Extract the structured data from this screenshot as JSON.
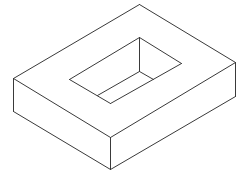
{
  "diagram": {
    "type": "isometric-line-drawing",
    "background": "#ffffff",
    "stroke_color": "#3a3a3a",
    "outer_block": {
      "top_face": [
        {
          "name": "block-top-left-edge",
          "x1": 13,
          "y1": 78,
          "x2": 139,
          "y2": 4
        },
        {
          "name": "block-top-back-edge",
          "x1": 139,
          "y1": 4,
          "x2": 235,
          "y2": 62
        },
        {
          "name": "block-top-right-edge",
          "x1": 235,
          "y1": 62,
          "x2": 110,
          "y2": 137
        },
        {
          "name": "block-top-front-edge",
          "x1": 110,
          "y1": 137,
          "x2": 13,
          "y2": 78
        }
      ],
      "vertical_edges": [
        {
          "name": "block-left-vertical-edge",
          "x1": 13,
          "y1": 78,
          "x2": 13,
          "y2": 111
        },
        {
          "name": "block-front-vertical-edge",
          "x1": 110,
          "y1": 137,
          "x2": 110,
          "y2": 169
        },
        {
          "name": "block-right-vertical-edge",
          "x1": 235,
          "y1": 62,
          "x2": 235,
          "y2": 96
        }
      ],
      "bottom_edges": [
        {
          "name": "block-bottom-left-edge",
          "x1": 13,
          "y1": 111,
          "x2": 110,
          "y2": 169
        },
        {
          "name": "block-bottom-right-edge",
          "x1": 110,
          "y1": 169,
          "x2": 235,
          "y2": 96
        }
      ]
    },
    "pocket": {
      "rim": [
        {
          "name": "pocket-rim-back-left-edge",
          "x1": 69,
          "y1": 79,
          "x2": 139,
          "y2": 37
        },
        {
          "name": "pocket-rim-back-right-edge",
          "x1": 139,
          "y1": 37,
          "x2": 181,
          "y2": 63
        },
        {
          "name": "pocket-rim-front-right-edge",
          "x1": 181,
          "y1": 63,
          "x2": 110,
          "y2": 103
        },
        {
          "name": "pocket-rim-front-left-edge",
          "x1": 110,
          "y1": 103,
          "x2": 69,
          "y2": 79
        }
      ],
      "inner": [
        {
          "name": "pocket-inner-vertical-edge",
          "x1": 139,
          "y1": 37,
          "x2": 139,
          "y2": 71
        },
        {
          "name": "pocket-floor-left-edge",
          "x1": 139,
          "y1": 71,
          "x2": 97,
          "y2": 95
        },
        {
          "name": "pocket-floor-right-edge",
          "x1": 139,
          "y1": 71,
          "x2": 153,
          "y2": 79
        }
      ]
    }
  }
}
